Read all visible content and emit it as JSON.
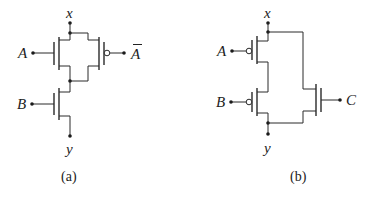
{
  "figures": [
    {
      "id": "a",
      "caption": "(a)",
      "terminals": {
        "top": "x",
        "bottom": "y"
      },
      "inputs": [
        {
          "label": "A",
          "type": "nmos"
        },
        {
          "label": "A",
          "type": "pmos",
          "overbar": true,
          "display": "Ā"
        },
        {
          "label": "B",
          "type": "nmos"
        }
      ],
      "topology": "(A || Ā) in series with B"
    },
    {
      "id": "b",
      "caption": "(b)",
      "terminals": {
        "top": "x",
        "bottom": "y"
      },
      "inputs": [
        {
          "label": "A",
          "type": "pmos"
        },
        {
          "label": "B",
          "type": "pmos"
        },
        {
          "label": "C",
          "type": "nmos"
        }
      ],
      "topology": "(A series B) || C"
    }
  ],
  "labels": {
    "a_x": "x",
    "a_y": "y",
    "a_A": "A",
    "a_Abar": "A",
    "a_B": "B",
    "a_caption": "(a)",
    "b_x": "x",
    "b_y": "y",
    "b_A": "A",
    "b_B": "B",
    "b_C": "C",
    "b_caption": "(b)"
  },
  "colors": {
    "line": "#2a2a2a",
    "background": "#ffffff"
  }
}
